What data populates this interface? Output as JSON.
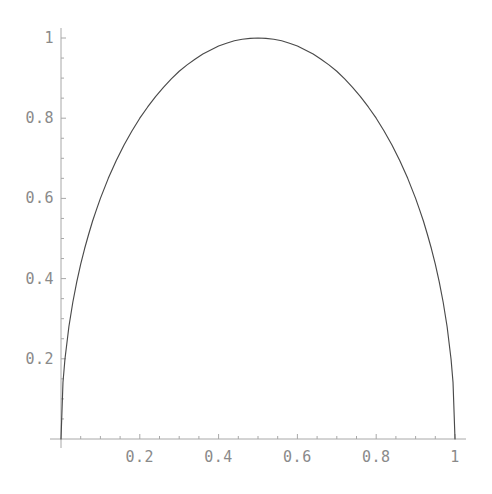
{
  "chart_data": {
    "type": "line",
    "title": "",
    "subtitle": "",
    "xlabel": "",
    "ylabel": "",
    "xlim": [
      0,
      1
    ],
    "ylim": [
      0,
      1.02
    ],
    "grid": false,
    "legend": null,
    "legend_position": "none",
    "axis_color": "#a8a8a8",
    "curve_color": "#4a4a4a",
    "tick_label_color": "#8a8a8a",
    "background_color": "#ffffff",
    "x_ticks": [
      {
        "value": 0.2,
        "label": "0.2"
      },
      {
        "value": 0.4,
        "label": "0.4"
      },
      {
        "value": 0.6,
        "label": "0.6"
      },
      {
        "value": 0.8,
        "label": "0.8"
      },
      {
        "value": 1.0,
        "label": "1"
      }
    ],
    "y_ticks": [
      {
        "value": 0.2,
        "label": "0.2"
      },
      {
        "value": 0.4,
        "label": "0.4"
      },
      {
        "value": 0.6,
        "label": "0.6"
      },
      {
        "value": 0.8,
        "label": "0.8"
      },
      {
        "value": 1.0,
        "label": "1"
      }
    ],
    "x_minor_ticks": [
      0.05,
      0.1,
      0.15,
      0.25,
      0.3,
      0.35,
      0.45,
      0.5,
      0.55,
      0.65,
      0.7,
      0.75,
      0.85,
      0.9,
      0.95
    ],
    "y_minor_ticks": [
      0.05,
      0.1,
      0.15,
      0.25,
      0.3,
      0.35,
      0.45,
      0.5,
      0.55,
      0.65,
      0.7,
      0.75,
      0.85,
      0.9,
      0.95
    ],
    "series": [
      {
        "name": "curve",
        "x": [
          0.0,
          0.005,
          0.01,
          0.02,
          0.03,
          0.04,
          0.05,
          0.06,
          0.07,
          0.08,
          0.09,
          0.1,
          0.12,
          0.14,
          0.16,
          0.18,
          0.2,
          0.22,
          0.24,
          0.26,
          0.28,
          0.3,
          0.32,
          0.34,
          0.36,
          0.38,
          0.4,
          0.42,
          0.44,
          0.46,
          0.48,
          0.5,
          0.52,
          0.54,
          0.56,
          0.58,
          0.6,
          0.62,
          0.64,
          0.66,
          0.68,
          0.7,
          0.72,
          0.74,
          0.76,
          0.78,
          0.8,
          0.82,
          0.84,
          0.86,
          0.88,
          0.9,
          0.91,
          0.92,
          0.93,
          0.94,
          0.95,
          0.96,
          0.97,
          0.98,
          0.99,
          0.995,
          1.0
        ],
        "y": [
          0.0,
          0.141,
          0.199,
          0.28,
          0.341,
          0.392,
          0.436,
          0.475,
          0.51,
          0.543,
          0.572,
          0.6,
          0.65,
          0.694,
          0.733,
          0.768,
          0.8,
          0.828,
          0.854,
          0.877,
          0.898,
          0.917,
          0.933,
          0.947,
          0.96,
          0.97,
          0.98,
          0.987,
          0.993,
          0.997,
          0.999,
          1.0,
          0.999,
          0.997,
          0.993,
          0.987,
          0.98,
          0.97,
          0.96,
          0.947,
          0.933,
          0.917,
          0.898,
          0.877,
          0.854,
          0.828,
          0.8,
          0.768,
          0.733,
          0.694,
          0.65,
          0.6,
          0.572,
          0.543,
          0.51,
          0.475,
          0.436,
          0.392,
          0.341,
          0.28,
          0.199,
          0.141,
          0.0
        ]
      }
    ]
  },
  "geometry": {
    "x0_px": 61,
    "x1_px": 455,
    "y0_px": 439,
    "y_unit_px": 401,
    "major_tick_len": 5,
    "minor_tick_len": 3
  }
}
